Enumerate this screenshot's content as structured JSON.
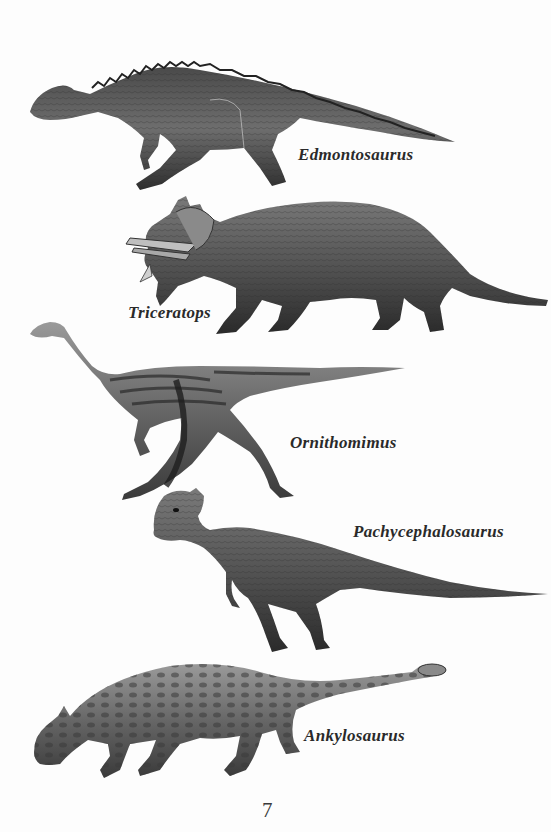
{
  "page": {
    "page_number": "7",
    "background_color": "#fdfdfd",
    "ink_color": "#2a2a2a"
  },
  "dinosaurs": [
    {
      "name": "Edmontosaurus",
      "illustration": "edmontosaurus-illustration"
    },
    {
      "name": "Triceratops",
      "illustration": "triceratops-illustration"
    },
    {
      "name": "Ornithomimus",
      "illustration": "ornithomimus-illustration"
    },
    {
      "name": "Pachycephalosaurus",
      "illustration": "pachycephalosaurus-illustration"
    },
    {
      "name": "Ankylosaurus",
      "illustration": "ankylosaurus-illustration"
    }
  ]
}
